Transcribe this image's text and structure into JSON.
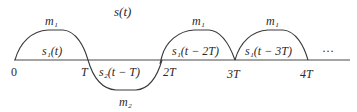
{
  "diagram": {
    "title": "s(t)",
    "axis": {
      "ticks": [
        {
          "label": "0"
        },
        {
          "label": "T"
        },
        {
          "label": "2T"
        },
        {
          "label": "3T"
        },
        {
          "label": "4T"
        }
      ],
      "continuation": "···"
    },
    "pulses": [
      {
        "label": "s₁(t)",
        "amplitude_label": "m₁",
        "polarity": "positive",
        "interval": "0 to T"
      },
      {
        "label": "s₂(t − T)",
        "amplitude_label": "m₂",
        "polarity": "negative",
        "interval": "T to 2T"
      },
      {
        "label": "s₁(t − 2T)",
        "amplitude_label": "m₁",
        "polarity": "positive",
        "interval": "2T to 3T"
      },
      {
        "label": "s₁(t − 3T)",
        "amplitude_label": "m₁",
        "polarity": "positive",
        "interval": "3T to 4T"
      }
    ]
  }
}
